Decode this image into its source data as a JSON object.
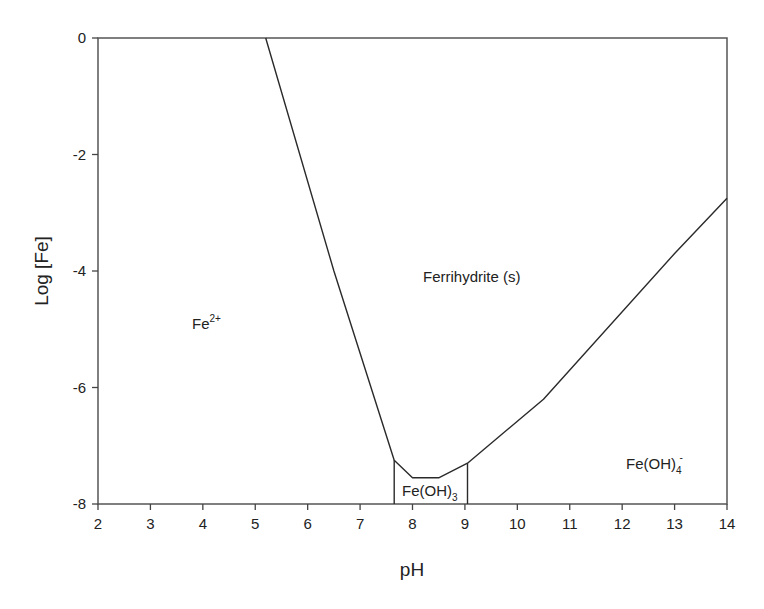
{
  "chart_data": {
    "type": "line",
    "title": "",
    "xlabel": "pH",
    "ylabel": "Log [Fe]",
    "xlim": [
      2,
      14
    ],
    "ylim": [
      -8,
      0
    ],
    "grid": false,
    "legend": null,
    "x_ticks": [
      2,
      3,
      4,
      5,
      6,
      7,
      8,
      9,
      10,
      11,
      12,
      13,
      14
    ],
    "y_ticks": [
      0,
      -2,
      -4,
      -6,
      -8
    ],
    "series": [
      {
        "name": "Ferrihydrite solubility boundary",
        "x": [
          5.2,
          6.5,
          7.65,
          8.0,
          8.5,
          9.05,
          10.5,
          13.0,
          14.0
        ],
        "y": [
          0,
          -4.0,
          -7.25,
          -7.55,
          -7.55,
          -7.3,
          -6.2,
          -3.7,
          -2.75
        ]
      },
      {
        "name": "Fe(OH)3 left boundary",
        "x": [
          7.65,
          7.65
        ],
        "y": [
          -7.25,
          -8
        ]
      },
      {
        "name": "Fe(OH)3 right boundary",
        "x": [
          9.05,
          9.05
        ],
        "y": [
          -7.3,
          -8
        ]
      }
    ],
    "annotations": [
      {
        "text": "Fe",
        "sup": "2+",
        "sub": "",
        "x": 3.8,
        "y": -5.0
      },
      {
        "text": "Ferrihydrite (s)",
        "sup": "",
        "sub": "",
        "x": 8.7,
        "y": -4.05
      },
      {
        "text": "Fe(OH)",
        "sup": "",
        "sub": "3",
        "x": 8.4,
        "y": -7.85
      },
      {
        "text": "Fe(OH)",
        "sup": "-",
        "sub": "4",
        "x": 12.5,
        "y": -7.4
      }
    ]
  },
  "labels": {
    "xlabel": "pH",
    "ylabel": "Log [Fe]",
    "fe2": "Fe",
    "fe2_sup": "2+",
    "ferrihydrite": "Ferrihydrite (s)",
    "feoh3": "Fe(OH)",
    "feoh3_sub": "3",
    "feoh4": "Fe(OH)",
    "feoh4_sub": "4",
    "feoh4_sup": "-"
  },
  "colors": {
    "line": "#2a2a2a",
    "axis": "#444444",
    "background": "#ffffff"
  }
}
